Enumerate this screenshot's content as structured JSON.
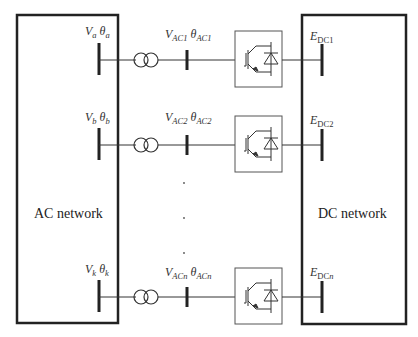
{
  "networks": {
    "ac": {
      "label": "AC network"
    },
    "dc": {
      "label": "DC network"
    }
  },
  "rows": [
    {
      "ac_bus": {
        "v": "V",
        "v_sub": "a",
        "theta": "θ",
        "theta_sub": "a"
      },
      "conv_ac_bus": {
        "v": "V",
        "v_sub": "AC1",
        "theta": "θ",
        "theta_sub": "AC1"
      },
      "dc_bus": {
        "e": "E",
        "e_sub": "DC1"
      }
    },
    {
      "ac_bus": {
        "v": "V",
        "v_sub": "b",
        "theta": "θ",
        "theta_sub": "b"
      },
      "conv_ac_bus": {
        "v": "V",
        "v_sub": "AC2",
        "theta": "θ",
        "theta_sub": "AC2"
      },
      "dc_bus": {
        "e": "E",
        "e_sub": "DC2"
      }
    },
    {
      "ac_bus": {
        "v": "V",
        "v_sub": "k",
        "theta": "θ",
        "theta_sub": "k"
      },
      "conv_ac_bus": {
        "v": "V",
        "v_sub": "ACn",
        "theta": "θ",
        "theta_sub": "ACn"
      },
      "dc_bus": {
        "e": "E",
        "e_sub": "DC",
        "e_sub_italic": "n"
      }
    }
  ],
  "ellipsis": "· · ·",
  "colors": {
    "line": "#222222",
    "box": "#555555"
  }
}
